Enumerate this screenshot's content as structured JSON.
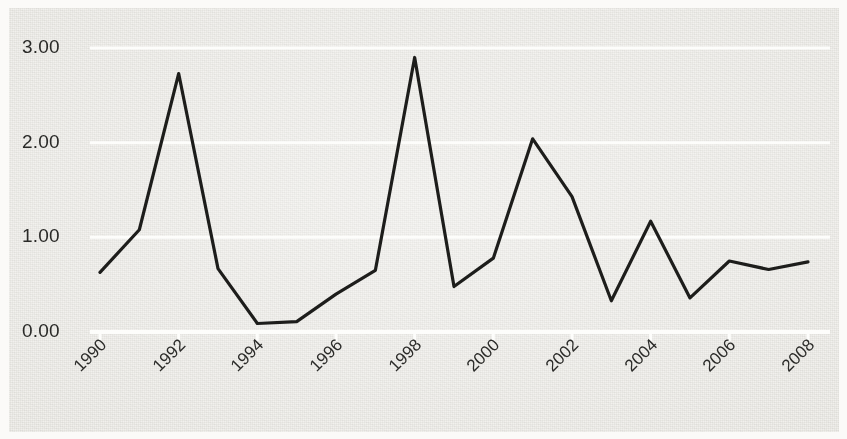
{
  "figure": {
    "width": 847,
    "height": 439,
    "background_color": "#efeeea",
    "gridline_color": "#fdfdfb",
    "line_color": "#1d1d1b",
    "text_color": "#2a2a28"
  },
  "chart_data": {
    "type": "line",
    "title": "",
    "subtitle": "",
    "xlabel": "",
    "ylabel": "",
    "grid": "horizontal",
    "legend": "none",
    "xlim": [
      1990,
      2008
    ],
    "ylim": [
      0.0,
      3.0
    ],
    "ytick_labels": [
      "0.00",
      "1.00",
      "2.00",
      "3.00"
    ],
    "ytick_values": [
      0.0,
      1.0,
      2.0,
      3.0
    ],
    "xtick_labels": [
      "1990",
      "1992",
      "1994",
      "1996",
      "1998",
      "2000",
      "2002",
      "2004",
      "2006",
      "2008"
    ],
    "xtick_values": [
      1990,
      1992,
      1994,
      1996,
      1998,
      2000,
      2002,
      2004,
      2006,
      2008
    ],
    "xtick_label_rotation": -45,
    "x": [
      1990,
      1991,
      1992,
      1993,
      1994,
      1995,
      1996,
      1997,
      1998,
      1999,
      2000,
      2001,
      2002,
      2003,
      2004,
      2005,
      2006,
      2007,
      2008
    ],
    "series": [
      {
        "name": "value",
        "values": [
          0.63,
          1.08,
          2.73,
          0.67,
          0.09,
          0.11,
          0.4,
          0.65,
          2.9,
          0.48,
          0.78,
          2.04,
          1.43,
          0.33,
          1.17,
          0.36,
          0.75,
          0.66,
          0.74
        ]
      }
    ],
    "annotations": []
  },
  "axes": {
    "plot_left_px": 100,
    "plot_right_px": 808,
    "y_zero_px": 332,
    "y_three_px": 48,
    "px_per_year": 39.33,
    "px_per_unit": 94.67
  }
}
